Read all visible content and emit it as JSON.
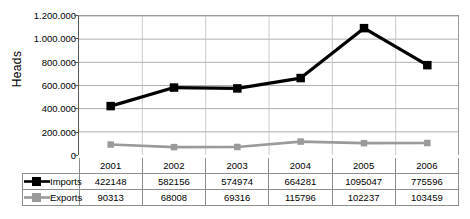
{
  "chart_data": {
    "type": "line",
    "title": "",
    "xlabel": "",
    "ylabel": "Heads",
    "ylim": [
      0,
      1200000
    ],
    "grid": true,
    "legend_position": "data-table-left",
    "number_format": "european-dot-thousands",
    "categories": [
      "2001",
      "2002",
      "2003",
      "2004",
      "2005",
      "2006"
    ],
    "ytick_labels": [
      "1.200.000",
      "1.000.000",
      "800.000",
      "600.000",
      "400.000",
      "200.000",
      "0"
    ],
    "ytick_values": [
      1200000,
      1000000,
      800000,
      600000,
      400000,
      200000,
      0
    ],
    "series": [
      {
        "name": "Imports",
        "color": "#000000",
        "marker": "square",
        "values": [
          422148,
          582156,
          574974,
          664281,
          1095047,
          775596
        ],
        "value_labels": [
          "422148",
          "582156",
          "574974",
          "664281",
          "1095047",
          "775596"
        ]
      },
      {
        "name": "Exports",
        "color": "#9a9a9a",
        "marker": "square",
        "values": [
          90313,
          68008,
          69316,
          115796,
          102237,
          103459
        ],
        "value_labels": [
          "90313",
          "68008",
          "69316",
          "115796",
          "102237",
          "103459"
        ]
      }
    ]
  },
  "table": {
    "header_row": [
      "2001",
      "2002",
      "2003",
      "2004",
      "2005",
      "2006"
    ],
    "rows": [
      {
        "label": "Imports",
        "cells": [
          "422148",
          "582156",
          "574974",
          "664281",
          "1095047",
          "775596"
        ]
      },
      {
        "label": "Exports",
        "cells": [
          "90313",
          "68008",
          "69316",
          "115796",
          "102237",
          "103459"
        ]
      }
    ]
  },
  "caption": ""
}
